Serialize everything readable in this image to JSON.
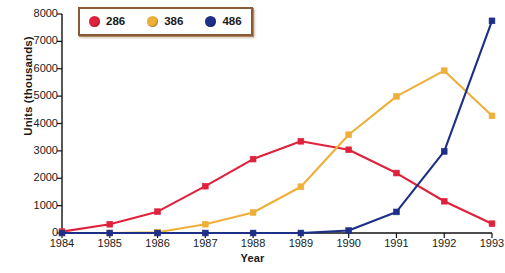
{
  "chart_data": {
    "type": "line",
    "title": "",
    "xlabel": "Year",
    "ylabel": "Units (thousands)",
    "x": [
      1984,
      1985,
      1986,
      1987,
      1988,
      1989,
      1990,
      1991,
      1992,
      1993
    ],
    "categories": [
      "1984",
      "1985",
      "1986",
      "1987",
      "1988",
      "1989",
      "1990",
      "1991",
      "1992",
      "1993"
    ],
    "xlim": [
      1984,
      1993
    ],
    "ylim": [
      0,
      8000
    ],
    "yticks": [
      0,
      1000,
      2000,
      3000,
      4000,
      5000,
      6000,
      7000,
      8000
    ],
    "ytick_labels": [
      "0",
      "1000",
      "2000",
      "3000",
      "4000",
      "5000",
      "6000",
      "7000",
      "8000"
    ],
    "grid": false,
    "legend_position": "top-left-inside",
    "series": [
      {
        "name": "286",
        "color": "#E0213C",
        "marker": "square",
        "values": [
          50,
          320,
          780,
          1710,
          2700,
          3350,
          3040,
          2190,
          1160,
          340
        ]
      },
      {
        "name": "386",
        "color": "#EFB03A",
        "marker": "square",
        "values": [
          0,
          0,
          30,
          320,
          750,
          1690,
          3590,
          4990,
          5930,
          4280
        ]
      },
      {
        "name": "486",
        "color": "#1D2F87",
        "marker": "square",
        "values": [
          0,
          0,
          0,
          0,
          0,
          0,
          90,
          770,
          2980,
          7750
        ]
      }
    ]
  },
  "legend": {
    "items": [
      {
        "label": "286",
        "color": "#E0213C"
      },
      {
        "label": "386",
        "color": "#EFB03A"
      },
      {
        "label": "486",
        "color": "#1D2F87"
      }
    ]
  },
  "axes": {
    "axis_color": "#111111",
    "background": "#FFFFFF"
  }
}
